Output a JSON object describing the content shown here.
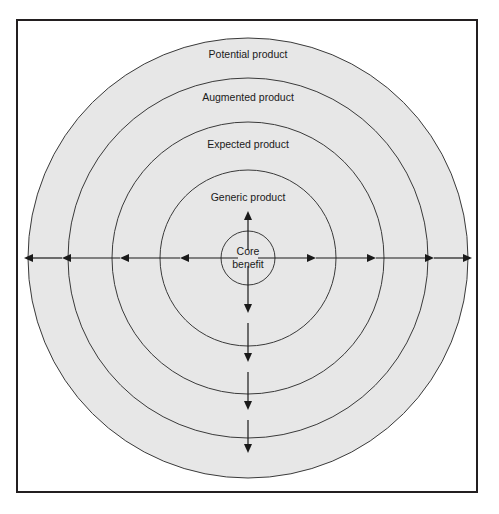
{
  "figure": {
    "frame": {
      "border_color": "#231f20",
      "background_color": "#ffffff"
    },
    "ring_fill_color": "#e7e7e7",
    "ring_stroke_color": "#3a3a3a",
    "arrow_color": "#1a1a1a",
    "center": {
      "x": 248,
      "y": 258
    },
    "rings": [
      {
        "id": "potential",
        "label": "Potential product",
        "radius": 220,
        "label_y": 58
      },
      {
        "id": "augmented",
        "label": "Augmented product",
        "radius": 180,
        "label_y": 101
      },
      {
        "id": "expected",
        "label": "Expected product",
        "radius": 136,
        "label_y": 148
      },
      {
        "id": "generic",
        "label": "Generic product",
        "radius": 88,
        "label_y": 201
      }
    ],
    "core": {
      "id": "core-benefit",
      "label_line1": "Core",
      "label_line2": "benefit",
      "radius": 27
    },
    "arrows": {
      "left_tips_x": [
        180,
        120,
        62,
        24
      ],
      "right_tips_x": [
        316,
        376,
        434,
        472
      ],
      "up_tip_y": 211,
      "down_tips_y": [
        313,
        362,
        410,
        453
      ]
    }
  }
}
